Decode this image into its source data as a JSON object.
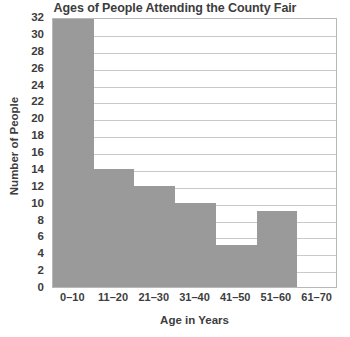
{
  "chart_data": {
    "type": "bar",
    "title": "Ages of People Attending the County Fair",
    "xlabel": "Age in Years",
    "ylabel": "Number of People",
    "categories": [
      "0–10",
      "11–20",
      "21–30",
      "31–40",
      "41–50",
      "51–60",
      "61–70"
    ],
    "values": [
      32,
      14,
      12,
      10,
      5,
      9,
      0
    ],
    "ylim": [
      0,
      32
    ],
    "ytick_step": 2,
    "yticks": [
      0,
      2,
      4,
      6,
      8,
      10,
      12,
      14,
      16,
      18,
      20,
      22,
      24,
      26,
      28,
      30,
      32
    ],
    "grid": "horizontal",
    "legend": "none",
    "bar_color": "#9a9a9a",
    "gridline_color": "#c9c9c9",
    "plot_border_color": "#b8b8b8",
    "background_color": "#ffffff",
    "text_color": "#3d3d3d"
  }
}
